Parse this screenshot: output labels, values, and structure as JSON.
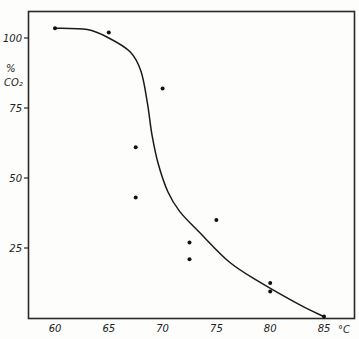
{
  "chart_data": {
    "type": "scatter",
    "title": "",
    "xlabel": "°C",
    "ylabel": "% CO₂",
    "ylabel_lines": [
      "%",
      "CO₂"
    ],
    "xlim": [
      57.5,
      87.7
    ],
    "ylim": [
      0,
      104
    ],
    "x_ticks": [
      60,
      65,
      70,
      75,
      80,
      85
    ],
    "y_ticks": [
      25,
      50,
      75,
      100
    ],
    "grid": false,
    "legend": null,
    "series": [
      {
        "name": "observed",
        "kind": "points",
        "x": [
          60,
          65,
          70,
          67.5,
          67.5,
          75,
          72.5,
          72.5,
          80,
          80,
          85
        ],
        "y": [
          103.5,
          102,
          82,
          61,
          43,
          35,
          27,
          21,
          12.5,
          9.5,
          0.5
        ]
      },
      {
        "name": "fitted curve",
        "kind": "line",
        "x": [
          60,
          63,
          65,
          67,
          68,
          68.6,
          69,
          69.6,
          70.5,
          71.6,
          73.4,
          76.2,
          79,
          82.8,
          85
        ],
        "y": [
          103.5,
          103,
          100,
          95,
          88,
          76.5,
          65.7,
          55,
          45,
          38,
          30.7,
          20,
          12.9,
          4.6,
          0.5
        ]
      }
    ]
  }
}
